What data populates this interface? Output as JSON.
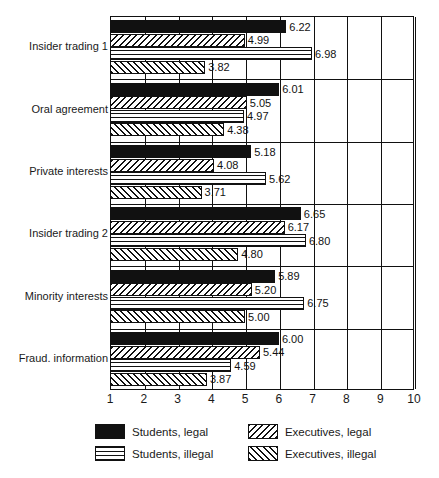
{
  "chart_data": {
    "type": "bar",
    "orientation": "horizontal",
    "title": "",
    "xlabel": "",
    "ylabel": "",
    "xlim": [
      1,
      10
    ],
    "xticks": [
      "1",
      "2",
      "3",
      "4",
      "5",
      "6",
      "7",
      "8",
      "9",
      "10"
    ],
    "grid": true,
    "legend_position": "bottom",
    "categories": [
      "Insider trading 1",
      "Oral agreement",
      "Private interests",
      "Insider trading 2",
      "Minority interests",
      "Fraud. information"
    ],
    "series": [
      {
        "name": "Students, legal",
        "pattern": "solid-black",
        "values": [
          6.22,
          6.01,
          5.18,
          6.65,
          5.89,
          6.0
        ],
        "labels": [
          "6.22",
          "6.01",
          "5.18",
          "6.65",
          "5.89",
          "6.00"
        ]
      },
      {
        "name": "Executives, legal",
        "pattern": "forward-diagonal-hatch",
        "values": [
          4.99,
          5.05,
          4.08,
          6.17,
          5.2,
          5.44
        ],
        "labels": [
          "4.99",
          "5.05",
          "4.08",
          "6.17",
          "5.20",
          "5.44"
        ]
      },
      {
        "name": "Students, illegal",
        "pattern": "cross-grid",
        "values": [
          6.98,
          4.97,
          5.62,
          6.8,
          6.75,
          4.59
        ],
        "labels": [
          "6.98",
          "4.97",
          "5.62",
          "6.80",
          "6.75",
          "4.59"
        ]
      },
      {
        "name": "Executives, illegal",
        "pattern": "backward-diagonal-hatch",
        "values": [
          3.82,
          4.38,
          3.71,
          4.8,
          5.0,
          3.87
        ],
        "labels": [
          "3.82",
          "4.38",
          "3.71",
          "4.80",
          "5.00",
          "3.87"
        ]
      }
    ]
  },
  "legend": {
    "items": [
      {
        "label": "Students, legal",
        "pattern": "solid-black"
      },
      {
        "label": "Executives, legal",
        "pattern": "forward-diagonal-hatch"
      },
      {
        "label": "Students, illegal",
        "pattern": "cross-grid"
      },
      {
        "label": "Executives, illegal",
        "pattern": "backward-diagonal-hatch"
      }
    ]
  }
}
